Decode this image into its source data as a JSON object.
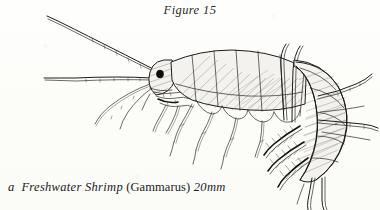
{
  "page": {
    "width": 380,
    "height": 210,
    "background_color": "#fdfdfb",
    "ink_color": "#1e1c1a"
  },
  "figure": {
    "title": "Figure 15",
    "caption": {
      "full_text": "a Freshwater Shrimp (Gammarus) 20mm",
      "article": "a",
      "common_name": "Freshwater Shrimp",
      "genus_parenthetical": "(Gammarus)",
      "scale": "20mm"
    },
    "illustration_style": "pen-and-ink line drawing with pencil hatching",
    "anatomy_labels": [
      "antenna-1",
      "antenna-2",
      "eye",
      "head",
      "mouthparts",
      "gnathopods",
      "pereon-segments",
      "pereopods",
      "pleon",
      "pleopods",
      "urosome",
      "uropods",
      "telson"
    ]
  }
}
